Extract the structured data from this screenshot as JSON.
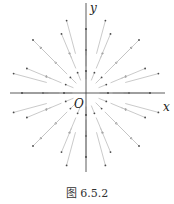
{
  "figure": {
    "caption": "图 6.5.2",
    "axes": {
      "x_label": "x",
      "y_label": "y",
      "origin_label": "O"
    },
    "colors": {
      "axis": "#333333",
      "vector": "#c4c4c4",
      "tip": "#4a4a4a"
    }
  },
  "chart_data": {
    "type": "vector_field",
    "title": "",
    "caption": "图 6.5.2",
    "xlabel": "x",
    "ylabel": "y",
    "origin": "O",
    "origin_px": [
      86,
      93
    ],
    "rings": [
      {
        "radius_px": 22,
        "length_px": 8,
        "count": 16
      },
      {
        "radius_px": 43,
        "length_px": 16,
        "count": 16
      },
      {
        "radius_px": 64,
        "length_px": 26,
        "count": 16
      },
      {
        "radius_px": 75,
        "length_px": 34,
        "count": 12
      }
    ],
    "x_axis_px": [
      10,
      165
    ],
    "y_axis_px": [
      3,
      172
    ]
  }
}
